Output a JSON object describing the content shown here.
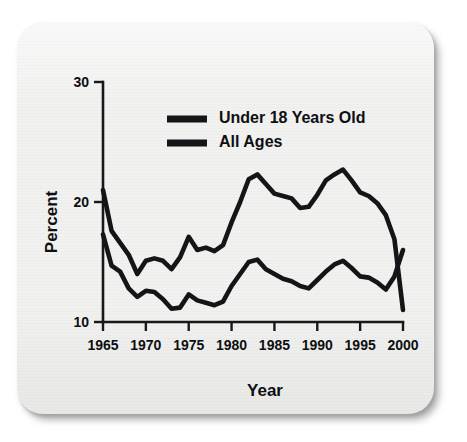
{
  "card": {
    "background_color": "#f1f1f0",
    "shadow_color": "#888888"
  },
  "chart_data": {
    "type": "line",
    "title": "",
    "subtitle": "",
    "xlabel": "Year",
    "ylabel": "Percent",
    "xlim": [
      1965,
      2000
    ],
    "ylim": [
      10,
      30
    ],
    "grid": false,
    "legend_position": "top-center",
    "x_ticks": [
      "1965",
      "1970",
      "1975",
      "1980",
      "1985",
      "1990",
      "1995",
      "2000"
    ],
    "x_tick_values": [
      1965,
      1970,
      1975,
      1980,
      1985,
      1990,
      1995,
      2000
    ],
    "y_ticks": [
      "10",
      "20",
      "30"
    ],
    "y_tick_values": [
      10,
      20,
      30
    ],
    "x": [
      1965,
      1966,
      1967,
      1968,
      1969,
      1970,
      1971,
      1972,
      1973,
      1974,
      1975,
      1976,
      1977,
      1978,
      1979,
      1980,
      1981,
      1982,
      1983,
      1984,
      1985,
      1986,
      1987,
      1988,
      1989,
      1990,
      1991,
      1992,
      1993,
      1994,
      1995,
      1996,
      1997,
      1998,
      1999,
      2000
    ],
    "series": [
      {
        "name": "Under 18 Years Old",
        "color": "#141517",
        "values": [
          21.0,
          17.6,
          16.6,
          15.6,
          14.0,
          15.1,
          15.3,
          15.1,
          14.4,
          15.4,
          17.1,
          16.0,
          16.2,
          15.9,
          16.4,
          18.3,
          20.0,
          21.9,
          22.3,
          21.5,
          20.7,
          20.5,
          20.3,
          19.5,
          19.6,
          20.6,
          21.8,
          22.3,
          22.7,
          21.8,
          20.8,
          20.5,
          19.9,
          18.9,
          16.9,
          11.0
        ]
      },
      {
        "name": "All Ages",
        "color": "#141517",
        "values": [
          17.3,
          14.7,
          14.2,
          12.8,
          12.1,
          12.6,
          12.5,
          11.9,
          11.1,
          11.2,
          12.3,
          11.8,
          11.6,
          11.4,
          11.7,
          13.0,
          14.0,
          15.0,
          15.2,
          14.4,
          14.0,
          13.6,
          13.4,
          13.0,
          12.8,
          13.5,
          14.2,
          14.8,
          15.1,
          14.5,
          13.8,
          13.7,
          13.3,
          12.7,
          13.8,
          16.0
        ]
      }
    ],
    "legend": [
      {
        "label": "Under 18 Years Old",
        "swatch": "thick-line-swatch"
      },
      {
        "label": "All Ages",
        "swatch": "thick-line-swatch"
      }
    ]
  }
}
